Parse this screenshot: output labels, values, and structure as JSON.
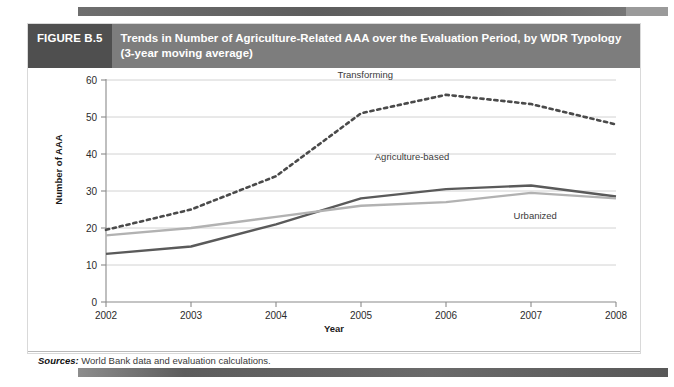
{
  "figure": {
    "number_label": "FIGURE B.5",
    "title_line1": "Trends in Number of Agriculture-Related AAA over the Evaluation Period, by WDR Typology",
    "title_line2": "(3-year moving average)",
    "sources_label": "Sources:",
    "sources_text": " World Bank data and evaluation calculations."
  },
  "colors": {
    "header_band": "#7d7d7d",
    "header_number_band": "#4f4f4f",
    "transforming": "#4a4a4a",
    "agriculture_based": "#5a5a5a",
    "urbanized": "#b2b2b2",
    "gridline": "#d2d2d2",
    "axis": "#8a8a8a"
  },
  "chart_data": {
    "type": "line",
    "title": "Trends in Number of Agriculture-Related AAA over the Evaluation Period, by WDR Typology (3-year moving average)",
    "xlabel": "Year",
    "ylabel": "Number of AAA",
    "x": [
      2002,
      2003,
      2004,
      2005,
      2006,
      2007,
      2008
    ],
    "categories": [
      "2002",
      "2003",
      "2004",
      "2005",
      "2006",
      "2007",
      "2008"
    ],
    "xlim": [
      2002,
      2008
    ],
    "ylim": [
      0,
      60
    ],
    "yticks": [
      0,
      10,
      20,
      30,
      40,
      50,
      60
    ],
    "grid": true,
    "legend_position": "inline-labels",
    "series": [
      {
        "name": "Transforming",
        "style": "dashed",
        "color": "#4a4a4a",
        "values": [
          19.5,
          25,
          34,
          51,
          56,
          53.5,
          48
        ],
        "label_x": 2005.05,
        "label_y": 60.5
      },
      {
        "name": "Agriculture-based",
        "style": "solid",
        "color": "#5a5a5a",
        "values": [
          13,
          15,
          21,
          28,
          30.5,
          31.5,
          28.5
        ],
        "label_x": 2005.6,
        "label_y": 38.5
      },
      {
        "name": "Urbanized",
        "style": "solid",
        "color": "#b2b2b2",
        "values": [
          18,
          20,
          23,
          26,
          27,
          29.5,
          28
        ],
        "label_x": 2007.05,
        "label_y": 22.5
      }
    ]
  }
}
